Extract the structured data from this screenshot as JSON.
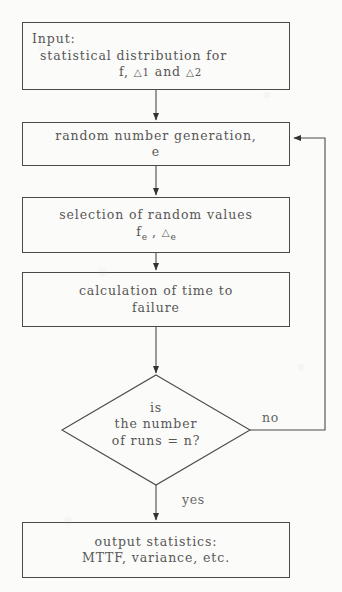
{
  "diagram": {
    "type": "flowchart",
    "stroke_color": "#4a4a4a",
    "text_color": "#575757",
    "background_color": "#fbfbf9"
  },
  "nodes": {
    "input": {
      "shape": "rectangle",
      "line1": "Input:",
      "line2": "statistical distribution for",
      "line3_prefix": "f, ",
      "line3_delta1": "△1",
      "line3_mid": " and  ",
      "line3_delta2": "△2"
    },
    "random": {
      "shape": "rectangle",
      "line1": "random number generation,",
      "line2": "e"
    },
    "selection": {
      "shape": "rectangle",
      "line1": "selection of random values",
      "line2_f": "f",
      "line2_fsub": "e",
      "line2_sep": " , ",
      "line2_delta": "△",
      "line2_dsub": "e"
    },
    "calculation": {
      "shape": "rectangle",
      "line1": "calculation of time to",
      "line2": "failure"
    },
    "decision": {
      "shape": "diamond",
      "line1": "is",
      "line2": "the number",
      "line3": "of runs = n?"
    },
    "output": {
      "shape": "rectangle",
      "line1": "output statistics:",
      "line2": "MTTF, variance, etc."
    }
  },
  "edge_labels": {
    "no": "no",
    "yes": "yes"
  }
}
